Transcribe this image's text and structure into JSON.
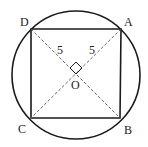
{
  "diagram": {
    "type": "geometry",
    "circle": {
      "cx": 76,
      "cy": 75,
      "r": 64
    },
    "points": {
      "A": {
        "label": "A",
        "x": 121,
        "y": 29
      },
      "B": {
        "label": "B",
        "x": 120,
        "y": 118
      },
      "C": {
        "label": "C",
        "x": 31,
        "y": 118
      },
      "D": {
        "label": "D",
        "x": 31,
        "y": 29
      },
      "O": {
        "label": "O",
        "x": 76,
        "y": 74
      }
    },
    "segment_labels": {
      "OD": "5",
      "OA": "5"
    },
    "right_angle_marker": true,
    "colors": {
      "stroke": "#1a1a1a",
      "dashed": "#555555",
      "background": "#ffffff"
    }
  }
}
